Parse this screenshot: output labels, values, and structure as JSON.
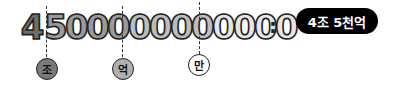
{
  "number": {
    "digits": [
      "4",
      "5",
      "0",
      "0",
      "0",
      "0",
      "0",
      "0",
      "0",
      "0",
      "0",
      "0",
      "0"
    ],
    "full": "4500000000000"
  },
  "group_colors": [
    "#6e6e6e",
    "#9a9a9a",
    "#bdbdbd",
    "#e6e6e6"
  ],
  "colon": ":",
  "result_badge": {
    "label": "4조 5천억"
  },
  "unit_labels": [
    {
      "label": "조",
      "fill": "#7a7a7a"
    },
    {
      "label": "억",
      "fill": "#b0b0b0"
    },
    {
      "label": "만",
      "fill": "#ffffff"
    }
  ]
}
